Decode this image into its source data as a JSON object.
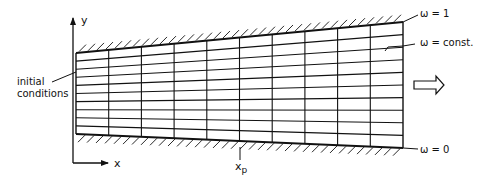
{
  "diagram": {
    "type": "computational-grid-schematic",
    "axis_labels": {
      "y": "y",
      "x": "x"
    },
    "labels": {
      "initial_conditions_line1": "initial",
      "initial_conditions_line2": "conditions",
      "omega_top": "ω = 1",
      "omega_const": "ω = const.",
      "omega_bottom": "ω = 0",
      "xp_main": "x",
      "xp_sub": "p"
    },
    "grid": {
      "columns": 10,
      "rows": 10,
      "left_x": 76,
      "right_x": 403,
      "left_top_y": 53,
      "left_bottom_y": 134,
      "right_top_y": 22,
      "right_bottom_y": 148
    },
    "flow_direction": "right",
    "colors": {
      "ink": "#111111",
      "background": "#ffffff"
    }
  }
}
